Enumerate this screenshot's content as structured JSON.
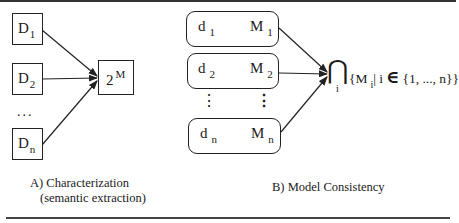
{
  "panel_a": {
    "inputs": [
      {
        "base": "D",
        "sub": "1"
      },
      {
        "base": "D",
        "sub": "2"
      },
      {
        "base": "D",
        "sub": "n"
      }
    ],
    "ellipsis": "...",
    "target": {
      "base": "2",
      "sup": "M"
    },
    "caption_line1": "A) Characterization",
    "caption_line2": "(semantic extraction)"
  },
  "panel_b": {
    "mappings": [
      {
        "d": "d",
        "d_sub": "1",
        "m": "M",
        "m_sub": "1"
      },
      {
        "d": "d",
        "d_sub": "2",
        "m": "M",
        "m_sub": "2"
      },
      {
        "d": "d",
        "d_sub": "n",
        "m": "M",
        "m_sub": "n"
      }
    ],
    "vertical_ellipsis": "⋮",
    "intersection_symbol": "⋂",
    "intersection_index": "i",
    "set_open": "{M",
    "set_index": "i",
    "set_condition": "| i",
    "element_of": "∈",
    "set_range": "{1, ..., n}}",
    "caption": "B) Model Consistency"
  },
  "colors": {
    "stroke": "#222222",
    "background": "#ffffff"
  }
}
